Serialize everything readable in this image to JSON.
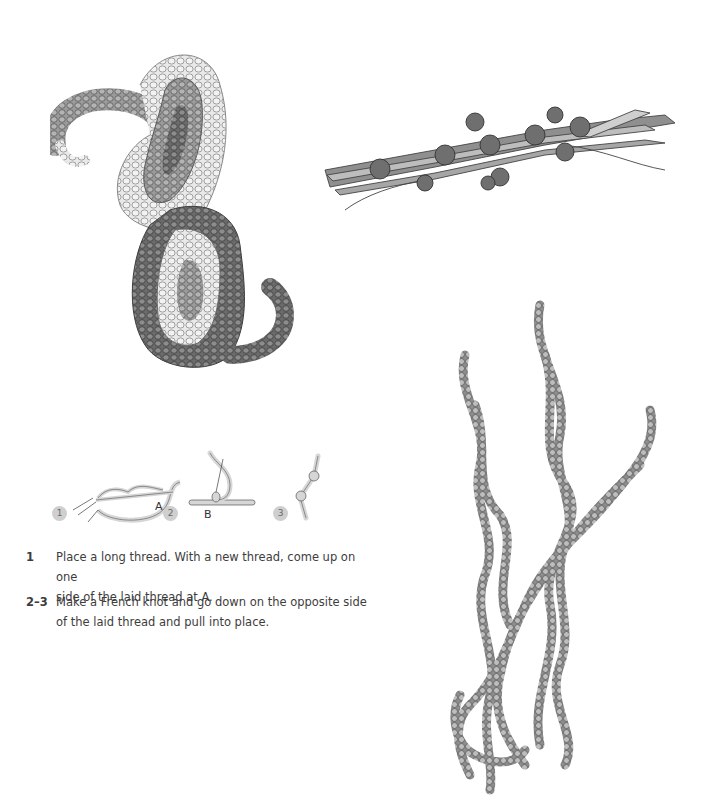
{
  "illustrations": [
    {
      "name": "paisley-couched-knots",
      "description": "Paisley shape worked in French knots"
    },
    {
      "name": "couched-bundle",
      "description": "Bundle of laid threads couched with French knots"
    },
    {
      "name": "knotted-chain-strands",
      "description": "Twisting strands of knotted couching"
    }
  ],
  "diagram": {
    "steps": [
      {
        "badge": "1",
        "label": "A"
      },
      {
        "badge": "2",
        "label": "B"
      },
      {
        "badge": "3",
        "label": ""
      }
    ]
  },
  "instructions": [
    {
      "number": "1",
      "lines": [
        "Place a long thread. With a new thread, come up on one",
        "side of the laid thread at A."
      ]
    },
    {
      "number": "2–3",
      "lines": [
        "Make a French knot and go down on the opposite side",
        "of the laid thread and pull into place."
      ]
    }
  ],
  "colors": {
    "badge_bg": "#cfcfcf",
    "thread_fill": "#d6d6d6",
    "ink": "#555555"
  }
}
